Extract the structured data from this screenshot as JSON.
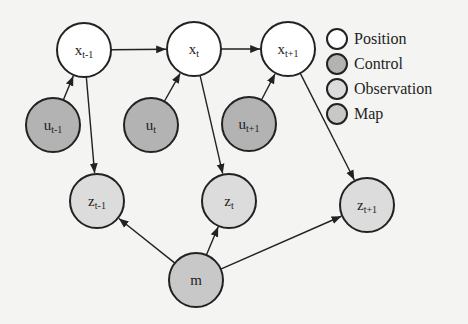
{
  "colors": {
    "background": "#f4f4f2",
    "position": "#ffffff",
    "control": "#b3b3b3",
    "observation": "#dcdcdc",
    "map": "#c8c8c8",
    "stroke": "#222222"
  },
  "nodes": [
    {
      "id": "x_prev",
      "base": "x",
      "sub": "t-1",
      "type": "position",
      "cx": 84,
      "cy": 50,
      "r": 27
    },
    {
      "id": "x_curr",
      "base": "x",
      "sub": "t",
      "type": "position",
      "cx": 194,
      "cy": 49,
      "r": 27
    },
    {
      "id": "x_next",
      "base": "x",
      "sub": "t+1",
      "type": "position",
      "cx": 288,
      "cy": 49,
      "r": 27
    },
    {
      "id": "u_prev",
      "base": "u",
      "sub": "t-1",
      "type": "control",
      "cx": 53,
      "cy": 125,
      "r": 27
    },
    {
      "id": "u_curr",
      "base": "u",
      "sub": "t",
      "type": "control",
      "cx": 151,
      "cy": 125,
      "r": 27
    },
    {
      "id": "u_next",
      "base": "u",
      "sub": "t+1",
      "type": "control",
      "cx": 249,
      "cy": 124,
      "r": 27
    },
    {
      "id": "z_prev",
      "base": "z",
      "sub": "t-1",
      "type": "observation",
      "cx": 97,
      "cy": 201,
      "r": 27
    },
    {
      "id": "z_curr",
      "base": "z",
      "sub": "t",
      "type": "observation",
      "cx": 229,
      "cy": 201,
      "r": 27
    },
    {
      "id": "z_next",
      "base": "z",
      "sub": "t+1",
      "type": "observation",
      "cx": 367,
      "cy": 205,
      "r": 27
    },
    {
      "id": "m",
      "base": "m",
      "sub": "",
      "type": "map",
      "cx": 196,
      "cy": 280,
      "r": 27
    }
  ],
  "edges": [
    {
      "from": "x_prev",
      "to": "x_curr"
    },
    {
      "from": "x_curr",
      "to": "x_next"
    },
    {
      "from": "u_prev",
      "to": "x_prev"
    },
    {
      "from": "u_curr",
      "to": "x_curr"
    },
    {
      "from": "u_next",
      "to": "x_next"
    },
    {
      "from": "x_prev",
      "to": "z_prev"
    },
    {
      "from": "x_curr",
      "to": "z_curr"
    },
    {
      "from": "x_next",
      "to": "z_next"
    },
    {
      "from": "m",
      "to": "z_prev"
    },
    {
      "from": "m",
      "to": "z_curr"
    },
    {
      "from": "m",
      "to": "z_next"
    }
  ],
  "legend": {
    "items": [
      {
        "label": "Position",
        "type": "position"
      },
      {
        "label": "Control",
        "type": "control"
      },
      {
        "label": "Observation",
        "type": "observation"
      },
      {
        "label": "Map",
        "type": "map"
      }
    ]
  }
}
